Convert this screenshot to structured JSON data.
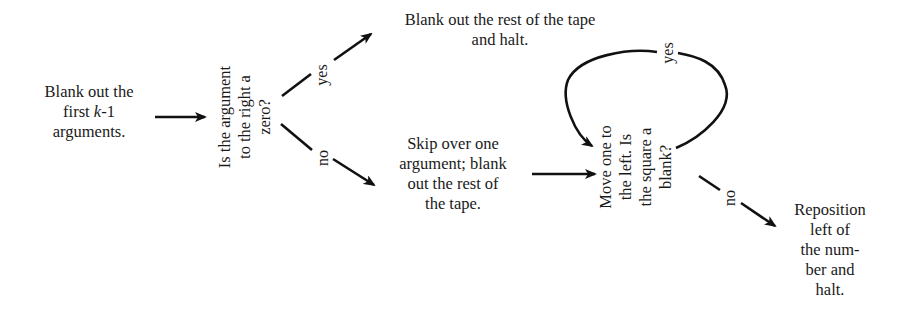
{
  "diagram": {
    "nodes": {
      "start": {
        "lines": [
          "Blank out the",
          "first k-1",
          "arguments."
        ],
        "line2_parts": [
          "first ",
          "k",
          "-1"
        ]
      },
      "question1": {
        "lines": [
          "Is the argument",
          "to the right a",
          "zero?"
        ]
      },
      "halt_blank": {
        "lines": [
          "Blank out the rest of the tape",
          "and halt."
        ]
      },
      "skip": {
        "lines": [
          "Skip over one",
          "argument; blank",
          "out the rest of",
          "the tape."
        ]
      },
      "question2": {
        "lines": [
          "Move one to",
          "the left. Is",
          "the square a",
          "blank?"
        ]
      },
      "reposition": {
        "lines": [
          "Reposition",
          "left of",
          "the num-",
          "ber and",
          "halt."
        ]
      }
    },
    "edge_labels": {
      "q1_yes": "yes",
      "q1_no": "no",
      "q2_yes": "yes",
      "q2_no": "no"
    },
    "edges": [
      {
        "from": "start",
        "to": "question1",
        "label": ""
      },
      {
        "from": "question1",
        "to": "halt_blank",
        "label": "yes"
      },
      {
        "from": "question1",
        "to": "skip",
        "label": "no"
      },
      {
        "from": "skip",
        "to": "question2",
        "label": ""
      },
      {
        "from": "question2",
        "to": "question2",
        "label": "yes"
      },
      {
        "from": "question2",
        "to": "reposition",
        "label": "no"
      }
    ]
  }
}
